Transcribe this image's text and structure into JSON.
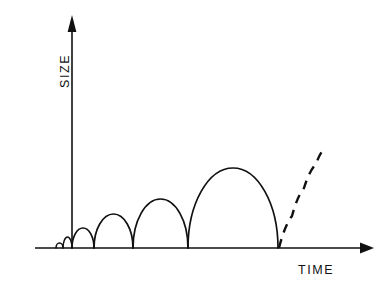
{
  "figure": {
    "title": "",
    "axes": {
      "y_label": "SIZE",
      "x_label": "TIME"
    }
  },
  "chart_data": {
    "type": "line",
    "title": "",
    "xlabel": "TIME",
    "ylabel": "SIZE",
    "xlim": [
      0,
      100
    ],
    "ylim": [
      0,
      100
    ],
    "grid": false,
    "legend": "none",
    "axis_style": "arrow-ended, no tick marks, no numeric tick labels",
    "series": [
      {
        "name": "growth-cycles",
        "style": "solid",
        "shape": "half-ellipse arches on baseline",
        "arches": [
          {
            "index": 1,
            "x_start": 56,
            "x_end": 63,
            "peak_x": 59.5,
            "peak_y": 243,
            "height_px": 5
          },
          {
            "index": 2,
            "x_start": 63,
            "x_end": 72,
            "peak_x": 67.5,
            "peak_y": 237,
            "height_px": 11
          },
          {
            "index": 3,
            "x_start": 72,
            "x_end": 94,
            "peak_x": 83,
            "peak_y": 228,
            "height_px": 20
          },
          {
            "index": 4,
            "x_start": 94,
            "x_end": 133,
            "peak_x": 113.5,
            "peak_y": 214,
            "height_px": 34
          },
          {
            "index": 5,
            "x_start": 133,
            "x_end": 188,
            "peak_x": 160.5,
            "peak_y": 199,
            "height_px": 49
          },
          {
            "index": 6,
            "x_start": 188,
            "x_end": 278,
            "peak_x": 233,
            "peak_y": 168,
            "height_px": 80
          }
        ]
      },
      {
        "name": "projected-growth",
        "style": "dashed",
        "shape": "ascending curve",
        "points": [
          {
            "x": 279,
            "y": 248
          },
          {
            "x": 292,
            "y": 216
          },
          {
            "x": 304,
            "y": 188
          },
          {
            "x": 316,
            "y": 164
          },
          {
            "x": 325,
            "y": 148
          }
        ]
      }
    ],
    "baseline_y": 248,
    "y_axis_x": 72,
    "colors": {
      "line": "#111111",
      "background": "#ffffff"
    }
  }
}
